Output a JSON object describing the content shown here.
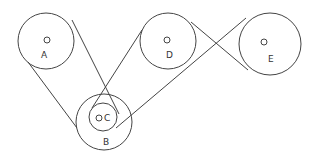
{
  "diagram": {
    "type": "pulley-belt-system",
    "stroke_color": "#444444",
    "pulleys": [
      {
        "id": "A",
        "label": "A",
        "cx": 46,
        "cy": 41,
        "r": 28,
        "hub": {
          "cx": 47,
          "cy": 40,
          "r": 3
        },
        "label_pos": [
          41,
          58
        ]
      },
      {
        "id": "D",
        "label": "D",
        "cx": 168,
        "cy": 41,
        "r": 28,
        "hub": {
          "cx": 167,
          "cy": 40,
          "r": 3
        },
        "label_pos": [
          166,
          58
        ]
      },
      {
        "id": "E",
        "label": "E",
        "cx": 270,
        "cy": 44,
        "r": 31,
        "hub": {
          "cx": 264,
          "cy": 42,
          "r": 3
        },
        "label_pos": [
          268,
          62
        ]
      },
      {
        "id": "B",
        "label": "B",
        "cx": 104,
        "cy": 122,
        "r": 28,
        "label_pos": [
          103,
          145
        ]
      },
      {
        "id": "C",
        "label": "C",
        "cx": 103,
        "cy": 117,
        "r": 14,
        "hub": {
          "cx": 99,
          "cy": 118,
          "r": 3
        },
        "label_pos": [
          104,
          121
        ]
      }
    ],
    "belts": [
      {
        "name": "belt-a-b-left",
        "from": [
          28,
          62
        ],
        "to": [
          77,
          128
        ]
      },
      {
        "name": "belt-a-c-cross",
        "from": [
          72,
          20
        ],
        "to": [
          119,
          114
        ]
      },
      {
        "name": "belt-d-c-cross",
        "from": [
          142,
          30
        ],
        "to": [
          92,
          108
        ]
      },
      {
        "name": "belt-e-c-long",
        "from": [
          246,
          18
        ],
        "to": [
          116,
          128
        ]
      },
      {
        "name": "belt-d-e-cross",
        "from": [
          191,
          22
        ],
        "to": [
          248,
          70
        ]
      }
    ]
  }
}
